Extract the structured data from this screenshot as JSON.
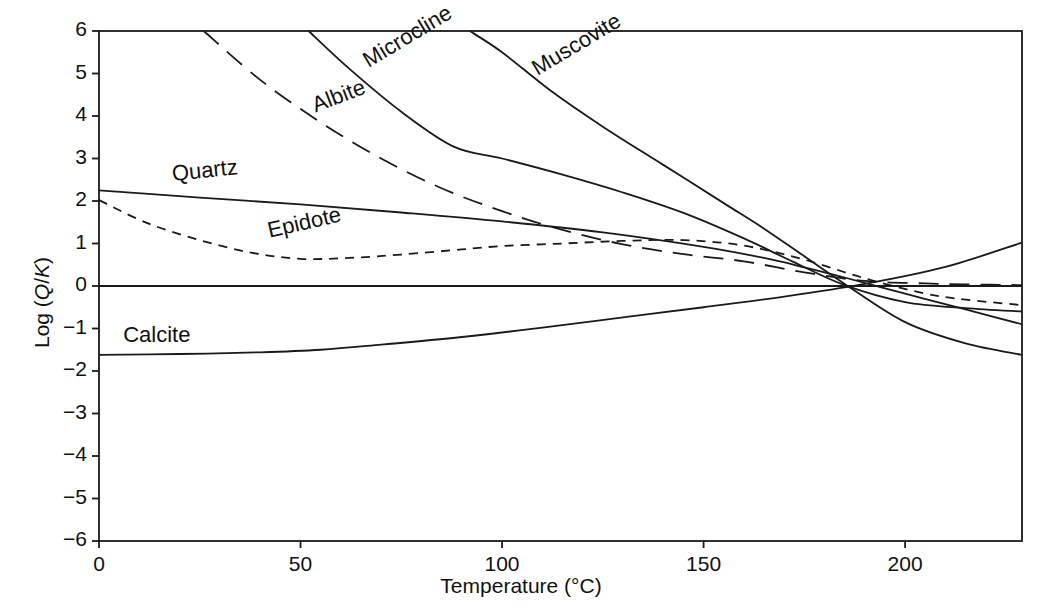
{
  "chart_data": {
    "type": "line",
    "title": "",
    "xlabel": "Temperature (°C)",
    "ylabel": "Log (Q/K)",
    "ylabel_parts": {
      "prefix": "Log (",
      "q": "Q",
      "slash": "/",
      "k": "K",
      "suffix": ")"
    },
    "xlim": [
      0,
      229
    ],
    "ylim": [
      -6,
      6
    ],
    "xticks": [
      0,
      50,
      100,
      150,
      200
    ],
    "xtick_labels": [
      "0",
      "50",
      "100",
      "150",
      "200"
    ],
    "yticks": [
      6,
      5,
      4,
      3,
      2,
      1,
      0,
      -1,
      -2,
      -3,
      -4,
      -5,
      -6
    ],
    "ytick_labels": [
      "6",
      "5",
      "4",
      "3",
      "2",
      "1",
      "0",
      "−1",
      "−2",
      "−3",
      "−4",
      "−5",
      "−6"
    ],
    "grid": false,
    "legend_position": "inline-labels",
    "line_color": "#1a1a1a",
    "reference_line": {
      "y": 0,
      "style": "solid",
      "note": "equilibrium Log (Q/K) = 0"
    },
    "series": [
      {
        "name": "Quartz",
        "style": "solid",
        "label_x": 18,
        "label_y": 2.62,
        "label_rotation": -6,
        "x": [
          0,
          25,
          50,
          75,
          100,
          125,
          150,
          165,
          175,
          185,
          200,
          215,
          229
        ],
        "y": [
          2.25,
          2.08,
          1.92,
          1.73,
          1.52,
          1.26,
          0.92,
          0.66,
          0.44,
          0.2,
          -0.18,
          -0.55,
          -0.9
        ]
      },
      {
        "name": "Epidote",
        "style": "dashed-short",
        "label_x": 42,
        "label_y": 1.28,
        "label_rotation": -13,
        "x": [
          0,
          12,
          25,
          38,
          50,
          62,
          75,
          90,
          100,
          115,
          130,
          145,
          160,
          175,
          190,
          205,
          215,
          229
        ],
        "y": [
          2.02,
          1.48,
          1.08,
          0.78,
          0.64,
          0.66,
          0.74,
          0.86,
          0.94,
          1.0,
          1.06,
          1.08,
          0.95,
          0.62,
          0.18,
          -0.18,
          -0.32,
          -0.45
        ]
      },
      {
        "name": "Albite",
        "style": "dashed-long",
        "label_x": 53,
        "label_y": 4.22,
        "label_rotation": -21,
        "x": [
          26,
          40,
          55,
          70,
          85,
          100,
          115,
          130,
          145,
          160,
          175,
          190,
          205,
          215,
          229
        ],
        "y": [
          6.0,
          4.85,
          3.85,
          3.0,
          2.3,
          1.76,
          1.32,
          0.98,
          0.75,
          0.58,
          0.32,
          0.12,
          0.06,
          0.04,
          0.02
        ]
      },
      {
        "name": "Microcline",
        "style": "solid",
        "label_x": 66,
        "label_y": 5.25,
        "label_rotation": -31,
        "x": [
          52,
          62,
          75,
          88,
          100,
          115,
          130,
          145,
          160,
          172,
          185,
          200,
          215,
          229
        ],
        "y": [
          6.0,
          5.12,
          4.1,
          3.28,
          3.0,
          2.62,
          2.2,
          1.72,
          1.12,
          0.58,
          0.02,
          -0.38,
          -0.52,
          -0.6
        ]
      },
      {
        "name": "Muscovite",
        "style": "solid",
        "label_x": 108,
        "label_y": 5.05,
        "label_rotation": -31,
        "x": [
          92,
          100,
          112,
          125,
          140,
          155,
          165,
          175,
          185,
          200,
          215,
          229
        ],
        "y": [
          6.0,
          5.5,
          4.6,
          3.75,
          2.85,
          1.95,
          1.35,
          0.7,
          0.05,
          -0.85,
          -1.35,
          -1.62
        ]
      },
      {
        "name": "Calcite",
        "style": "solid",
        "label_x": 6,
        "label_y": -1.18,
        "label_rotation": 0,
        "x": [
          0,
          20,
          40,
          55,
          70,
          90,
          110,
          130,
          150,
          170,
          190,
          210,
          229
        ],
        "y": [
          -1.62,
          -1.6,
          -1.56,
          -1.5,
          -1.38,
          -1.2,
          -0.98,
          -0.74,
          -0.5,
          -0.25,
          0.05,
          0.45,
          1.02
        ]
      }
    ]
  },
  "axes": {
    "x_title": "Temperature (°C)",
    "y_title": "Log (Q/K)"
  }
}
